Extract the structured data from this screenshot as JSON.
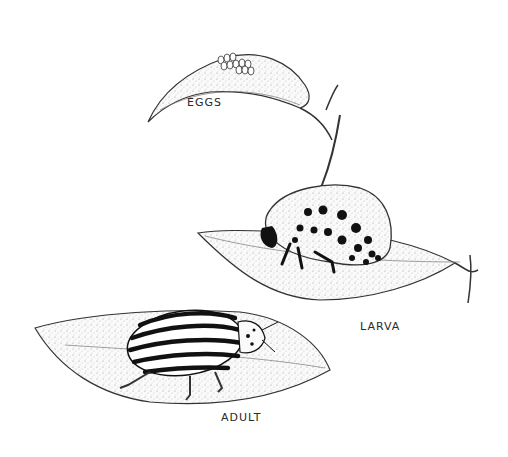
{
  "illustration": {
    "subject": "beetle life cycle on leaves",
    "stages": [
      {
        "label": "EGGS"
      },
      {
        "label": "LARVA"
      },
      {
        "label": "ADULT"
      }
    ]
  }
}
